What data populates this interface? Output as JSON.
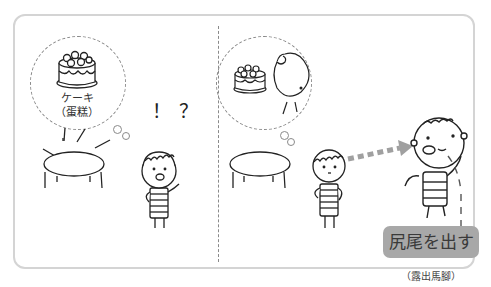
{
  "illustration": {
    "panel_left": {
      "thought_bubble": {
        "object": "cake-icon",
        "label_jp": "ケーキ",
        "label_cn": "（蛋糕）"
      },
      "reaction": "！？",
      "scene": [
        "table-icon",
        "child-surprised-icon"
      ]
    },
    "panel_right": {
      "thought_bubble": {
        "object": "character-eating-cake-icon"
      },
      "scene": [
        "table-icon",
        "child-icon",
        "arrow-icon",
        "bald-character-icon"
      ],
      "idiom": {
        "text_jp": "尻尾を出す",
        "text_cn": "（露出馬腳）"
      }
    }
  },
  "colors": {
    "frame_border": "#d4d4d4",
    "idiom_box": "#a8a8a8",
    "arrow": "#a0a0a0",
    "line": "#222222"
  }
}
